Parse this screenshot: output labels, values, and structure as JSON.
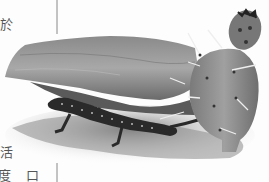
{
  "image": {
    "description": "Scanned book page illustration: a spotted lizard crawling beneath an overhanging rock next to a prickly pear cactus with a fruit on top",
    "style": "grayscale engraving",
    "subjects": [
      "lizard",
      "rock",
      "prickly pear cactus",
      "cactus fruit",
      "ground"
    ]
  },
  "text_fragments": {
    "top_left": "於",
    "bottom_left_1": "活",
    "bottom_left_2": "度",
    "bottom_left_3": "口"
  },
  "colors": {
    "paper": "#fdfdfd",
    "rock": "#9a9a9a",
    "rock_shadow": "#5a5a5a",
    "cactus": "#8c8c8c",
    "lizard": "#2a2a2a",
    "spines": "#eeeeee"
  }
}
